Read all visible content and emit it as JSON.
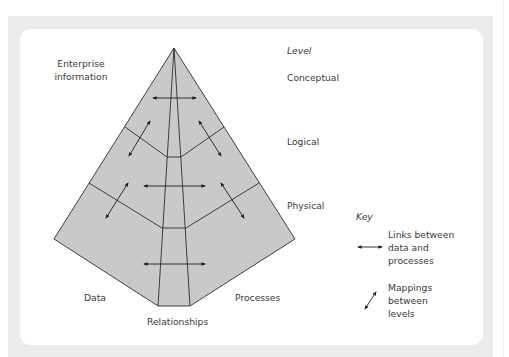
{
  "diagram": {
    "title_label": [
      "Enterprise",
      "information"
    ],
    "level_header": "Level",
    "levels": [
      "Conceptual",
      "Logical",
      "Physical"
    ],
    "sections": {
      "data": "Data",
      "relationships": "Relationships",
      "processes": "Processes"
    },
    "key": {
      "title": "Key",
      "items": [
        {
          "icon": "horizontal-double-arrow-icon",
          "lines": [
            "Links between",
            "data and",
            "processes"
          ]
        },
        {
          "icon": "diagonal-double-arrow-icon",
          "lines": [
            "Mappings",
            "between",
            "levels"
          ]
        }
      ]
    },
    "colors": {
      "panel_background": "#ececec",
      "canvas_background": "#ffffff",
      "pyramid_fill": "#c9c9c9",
      "stroke": "#2e2e2e",
      "text": "#3a3a3a"
    }
  }
}
